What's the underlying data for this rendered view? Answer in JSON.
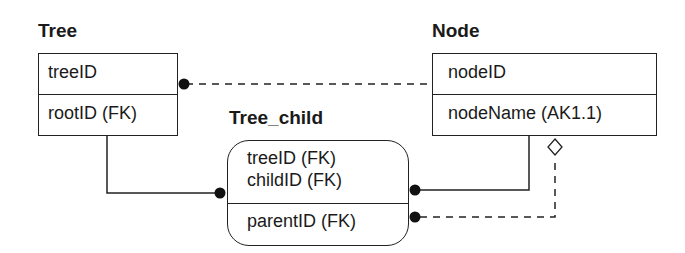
{
  "entities": {
    "tree": {
      "title": "Tree",
      "key_attributes": [
        "treeID"
      ],
      "non_key_attributes": [
        "rootID (FK)"
      ],
      "shape": "square"
    },
    "node": {
      "title": "Node",
      "key_attributes": [
        "nodeID"
      ],
      "non_key_attributes": [
        "nodeName (AK1.1)"
      ],
      "shape": "square"
    },
    "tree_child": {
      "title": "Tree_child",
      "key_attributes": [
        "treeID (FK)",
        "childID (FK)"
      ],
      "non_key_attributes": [
        "parentID (FK)"
      ],
      "shape": "rounded"
    }
  },
  "relationships": [
    {
      "from": "Tree",
      "to": "Node",
      "style": "dashed",
      "end_symbol": "dot",
      "end_at": "Tree",
      "meaning": "non-identifying (rootID)"
    },
    {
      "from": "Tree",
      "to": "Tree_child",
      "style": "solid",
      "end_symbol": "dot",
      "end_at": "Tree_child",
      "meaning": "identifying (treeID)"
    },
    {
      "from": "Node",
      "to": "Tree_child",
      "style": "solid",
      "end_symbol": "dot",
      "end_at": "Tree_child",
      "meaning": "identifying (childID)"
    },
    {
      "from": "Node",
      "to": "Tree_child",
      "style": "dashed",
      "start_symbol": "diamond",
      "end_symbol": "dot",
      "end_at": "Tree_child",
      "meaning": "non-identifying optional (parentID)"
    }
  ],
  "colors": {
    "line": "#222222",
    "background": "#ffffff",
    "text": "#1a1a1a"
  }
}
